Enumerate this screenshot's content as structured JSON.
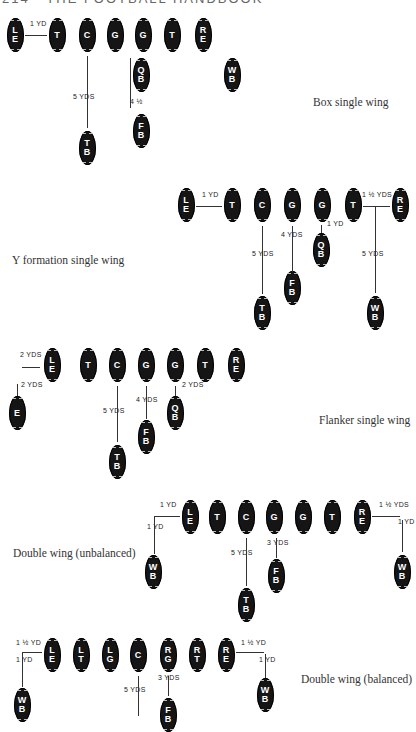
{
  "header": {
    "page_number": "214",
    "title": "THE FOOTBALL HANDBOOK"
  },
  "formations": [
    {
      "name": "Box single wing",
      "label_pos": [
        313,
        104
      ],
      "players": [
        {
          "pos": "LE",
          "x": 15,
          "y": 35
        },
        {
          "pos": "T",
          "x": 57,
          "y": 35
        },
        {
          "pos": "C",
          "x": 87,
          "y": 35
        },
        {
          "pos": "G",
          "x": 115,
          "y": 35
        },
        {
          "pos": "G",
          "x": 143,
          "y": 35
        },
        {
          "pos": "T",
          "x": 172,
          "y": 35
        },
        {
          "pos": "RE",
          "x": 203,
          "y": 35
        },
        {
          "pos": "QB",
          "x": 141,
          "y": 75
        },
        {
          "pos": "WB",
          "x": 232,
          "y": 75
        },
        {
          "pos": "TB",
          "x": 87,
          "y": 148
        },
        {
          "pos": "FB",
          "x": 141,
          "y": 131
        }
      ],
      "distances": [
        {
          "text": "1 YD",
          "x": 30,
          "y": 24
        },
        {
          "text": "5 YDS",
          "x": 73,
          "y": 97
        },
        {
          "text": "4 ½",
          "x": 130,
          "y": 102
        }
      ]
    },
    {
      "name": "Y formation single wing",
      "label_pos": [
        12,
        262
      ],
      "players": [
        {
          "pos": "LE",
          "x": 186,
          "y": 205
        },
        {
          "pos": "T",
          "x": 232,
          "y": 205
        },
        {
          "pos": "C",
          "x": 262,
          "y": 205
        },
        {
          "pos": "G",
          "x": 292,
          "y": 205
        },
        {
          "pos": "G",
          "x": 322,
          "y": 205
        },
        {
          "pos": "T",
          "x": 353,
          "y": 205
        },
        {
          "pos": "RE",
          "x": 400,
          "y": 205
        },
        {
          "pos": "QB",
          "x": 321,
          "y": 250
        },
        {
          "pos": "FB",
          "x": 292,
          "y": 288
        },
        {
          "pos": "TB",
          "x": 262,
          "y": 313
        },
        {
          "pos": "WB",
          "x": 375,
          "y": 313
        }
      ],
      "distances": [
        {
          "text": "1 YD",
          "x": 202,
          "y": 195
        },
        {
          "text": "1 ½ YDS",
          "x": 362,
          "y": 195
        },
        {
          "text": "1 YD",
          "x": 327,
          "y": 224
        },
        {
          "text": "4 YDS",
          "x": 281,
          "y": 235
        },
        {
          "text": "5 YDS",
          "x": 252,
          "y": 254
        },
        {
          "text": "5 YDS",
          "x": 362,
          "y": 254
        }
      ]
    },
    {
      "name": "Flanker single wing",
      "label_pos": [
        319,
        422
      ],
      "players": [
        {
          "pos": "LE",
          "x": 52,
          "y": 365
        },
        {
          "pos": "T",
          "x": 88,
          "y": 365
        },
        {
          "pos": "C",
          "x": 117,
          "y": 365
        },
        {
          "pos": "G",
          "x": 146,
          "y": 365
        },
        {
          "pos": "G",
          "x": 175,
          "y": 365
        },
        {
          "pos": "T",
          "x": 205,
          "y": 365
        },
        {
          "pos": "RE",
          "x": 236,
          "y": 365
        },
        {
          "pos": "E",
          "x": 17,
          "y": 413
        },
        {
          "pos": "QB",
          "x": 175,
          "y": 413
        },
        {
          "pos": "FB",
          "x": 146,
          "y": 437
        },
        {
          "pos": "TB",
          "x": 117,
          "y": 462
        }
      ],
      "distances": [
        {
          "text": "2 YDS",
          "x": 20,
          "y": 355
        },
        {
          "text": "2 YDS",
          "x": 21,
          "y": 385
        },
        {
          "text": "2 YDS",
          "x": 182,
          "y": 385
        },
        {
          "text": "4 YDS",
          "x": 136,
          "y": 400
        },
        {
          "text": "5 YDS",
          "x": 103,
          "y": 411
        }
      ]
    },
    {
      "name": "Double wing (unbalanced)",
      "label_pos": [
        13,
        555
      ],
      "players": [
        {
          "pos": "LE",
          "x": 190,
          "y": 517
        },
        {
          "pos": "T",
          "x": 217,
          "y": 517
        },
        {
          "pos": "C",
          "x": 246,
          "y": 517
        },
        {
          "pos": "G",
          "x": 274,
          "y": 517
        },
        {
          "pos": "G",
          "x": 303,
          "y": 517
        },
        {
          "pos": "T",
          "x": 332,
          "y": 517
        },
        {
          "pos": "RE",
          "x": 362,
          "y": 517
        },
        {
          "pos": "WB",
          "x": 153,
          "y": 572
        },
        {
          "pos": "WB",
          "x": 402,
          "y": 572
        },
        {
          "pos": "FB",
          "x": 276,
          "y": 576
        },
        {
          "pos": "TB",
          "x": 246,
          "y": 605
        }
      ],
      "distances": [
        {
          "text": "1 YD",
          "x": 160,
          "y": 505
        },
        {
          "text": "1 YD",
          "x": 147,
          "y": 527
        },
        {
          "text": "1 ½ YDS",
          "x": 379,
          "y": 505
        },
        {
          "text": "1 YD",
          "x": 398,
          "y": 522
        },
        {
          "text": "3 YDS",
          "x": 267,
          "y": 543
        },
        {
          "text": "5 YDS",
          "x": 231,
          "y": 553
        }
      ]
    },
    {
      "name": "Double wing (balanced)",
      "label_pos": [
        301,
        681
      ],
      "players": [
        {
          "pos": "LE",
          "x": 52,
          "y": 655
        },
        {
          "pos": "LT",
          "x": 81,
          "y": 655
        },
        {
          "pos": "LG",
          "x": 110,
          "y": 655
        },
        {
          "pos": "C",
          "x": 138,
          "y": 655
        },
        {
          "pos": "RG",
          "x": 168,
          "y": 655
        },
        {
          "pos": "RT",
          "x": 197,
          "y": 655
        },
        {
          "pos": "RE",
          "x": 226,
          "y": 655
        },
        {
          "pos": "WB",
          "x": 22,
          "y": 705
        },
        {
          "pos": "WB",
          "x": 265,
          "y": 695
        },
        {
          "pos": "FB",
          "x": 168,
          "y": 715
        }
      ],
      "distances": [
        {
          "text": "1 ½ YD",
          "x": 16,
          "y": 643
        },
        {
          "text": "1 YD",
          "x": 16,
          "y": 660
        },
        {
          "text": "1 ½ YD",
          "x": 241,
          "y": 643
        },
        {
          "text": "1 YD",
          "x": 259,
          "y": 660
        },
        {
          "text": "3 YDS",
          "x": 158,
          "y": 678
        },
        {
          "text": "5 YDS",
          "x": 124,
          "y": 690
        }
      ]
    }
  ]
}
